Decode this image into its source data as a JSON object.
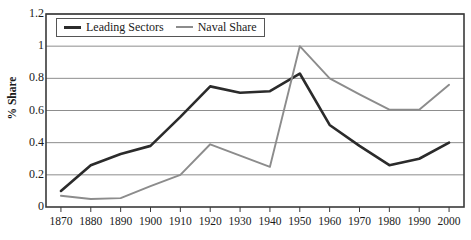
{
  "chart_data": {
    "type": "line",
    "title": "",
    "xlabel": "",
    "ylabel": "% Share",
    "x": [
      1870,
      1880,
      1890,
      1900,
      1910,
      1920,
      1930,
      1940,
      1950,
      1960,
      1970,
      1980,
      1990,
      2000
    ],
    "xlim": [
      1865,
      2005
    ],
    "ylim": [
      0,
      1.2
    ],
    "y_ticks": [
      0,
      0.2,
      0.4,
      0.6,
      0.8,
      1,
      1.2
    ],
    "y_tick_labels": [
      "0",
      "0.2",
      "0.4",
      "0.6",
      "0.8",
      "1",
      "1.2"
    ],
    "x_tick_labels": [
      "1870",
      "1880",
      "1890",
      "1900",
      "1910",
      "1920",
      "1930",
      "1940",
      "1950",
      "1960",
      "1970",
      "1980",
      "1990",
      "2000"
    ],
    "grid": true,
    "legend_position": "top-left",
    "series": [
      {
        "name": "Leading Sectors",
        "color": "#2b2b2b",
        "values": [
          0.1,
          0.26,
          0.33,
          0.38,
          0.56,
          0.75,
          0.71,
          0.72,
          0.83,
          0.51,
          0.38,
          0.26,
          0.3,
          0.4
        ]
      },
      {
        "name": "Naval Share",
        "color": "#8c8c8c",
        "values": [
          0.07,
          0.05,
          0.055,
          0.13,
          0.2,
          0.39,
          0.32,
          0.25,
          1.0,
          0.8,
          0.7,
          0.605,
          0.605,
          0.76
        ]
      }
    ]
  },
  "legend": {
    "items": [
      {
        "label": "Leading Sectors",
        "color": "#2b2b2b"
      },
      {
        "label": "Naval Share",
        "color": "#8c8c8c"
      }
    ]
  },
  "axes": {
    "y_title": "% Share"
  },
  "colors": {
    "leading_sectors": "#2b2b2b",
    "naval_share": "#8c8c8c",
    "grid": "#8d8d8d",
    "frame": "#3a3a3a",
    "background": "#ffffff"
  }
}
